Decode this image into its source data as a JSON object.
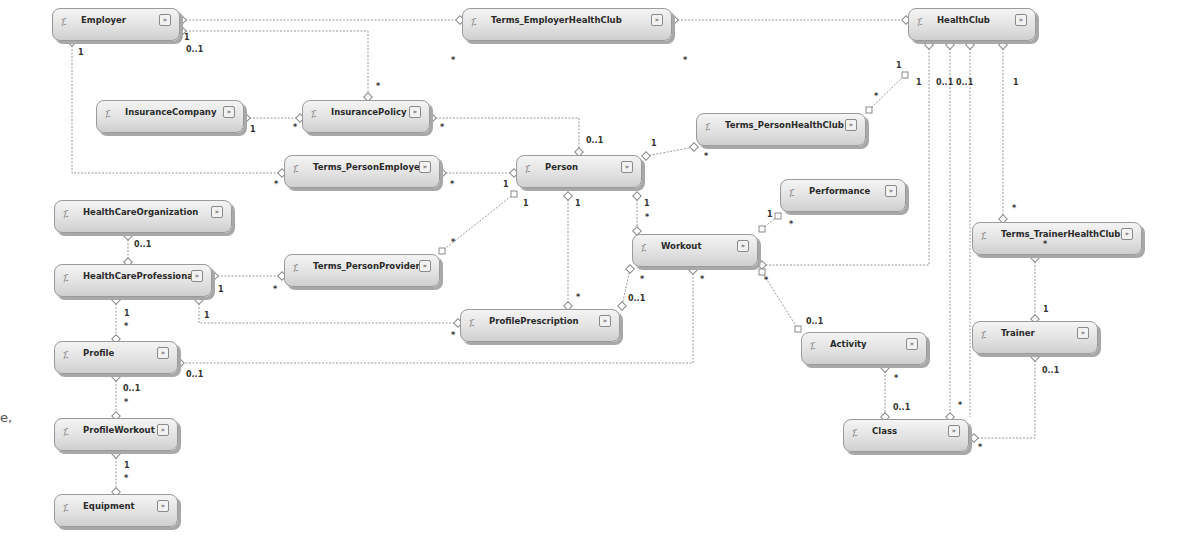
{
  "diagram": {
    "type": "entity-data-model",
    "entities": [
      {
        "id": "employer",
        "name": "Employer",
        "x": 52,
        "y": 8,
        "w": 128
      },
      {
        "id": "terms-employer-healthclub",
        "name": "Terms_EmployerHealthClub",
        "x": 462,
        "y": 8,
        "w": 210
      },
      {
        "id": "healthclub",
        "name": "HealthClub",
        "x": 908,
        "y": 8,
        "w": 128
      },
      {
        "id": "insurance-company",
        "name": "InsuranceCompany",
        "x": 96,
        "y": 100,
        "w": 148
      },
      {
        "id": "insurance-policy",
        "name": "InsurancePolicy",
        "x": 302,
        "y": 100,
        "w": 128
      },
      {
        "id": "terms-person-healthclub",
        "name": "Terms_PersonHealthClub",
        "x": 696,
        "y": 113,
        "w": 170
      },
      {
        "id": "terms-person-employer",
        "name": "Terms_PersonEmployer",
        "x": 284,
        "y": 155,
        "w": 156
      },
      {
        "id": "person",
        "name": "Person",
        "x": 516,
        "y": 155,
        "w": 126
      },
      {
        "id": "performance",
        "name": "Performance",
        "x": 780,
        "y": 179,
        "w": 126
      },
      {
        "id": "healthcare-organization",
        "name": "HealthCareOrganization",
        "x": 54,
        "y": 200,
        "w": 178
      },
      {
        "id": "workout",
        "name": "Workout",
        "x": 632,
        "y": 234,
        "w": 126
      },
      {
        "id": "terms-trainer-healthclub",
        "name": "Terms_TrainerHealthClub",
        "x": 972,
        "y": 222,
        "w": 170
      },
      {
        "id": "healthcare-professional",
        "name": "HealthCareProfessional",
        "x": 54,
        "y": 264,
        "w": 158
      },
      {
        "id": "terms-person-provider",
        "name": "Terms_PersonProvider",
        "x": 284,
        "y": 254,
        "w": 156
      },
      {
        "id": "profile-prescription",
        "name": "ProfilePrescription",
        "x": 460,
        "y": 309,
        "w": 160
      },
      {
        "id": "trainer",
        "name": "Trainer",
        "x": 972,
        "y": 321,
        "w": 126
      },
      {
        "id": "activity",
        "name": "Activity",
        "x": 801,
        "y": 332,
        "w": 126
      },
      {
        "id": "profile",
        "name": "Profile",
        "x": 54,
        "y": 341,
        "w": 124
      },
      {
        "id": "profile-workout",
        "name": "ProfileWorkout",
        "x": 54,
        "y": 418,
        "w": 124
      },
      {
        "id": "class",
        "name": "Class",
        "x": 843,
        "y": 419,
        "w": 126
      },
      {
        "id": "equipment",
        "name": "Equipment",
        "x": 54,
        "y": 494,
        "w": 124
      }
    ],
    "associations": [
      {
        "from": "Employer",
        "to": "Terms_EmployerHealthClub",
        "from_mult": "",
        "to_mult": "*"
      },
      {
        "from": "Terms_EmployerHealthClub",
        "to": "HealthClub",
        "from_mult": "*",
        "to_mult": "1"
      },
      {
        "from": "Employer",
        "to": "InsurancePolicy",
        "from_mult": "1",
        "to_mult": "*"
      },
      {
        "from": "Employer",
        "to": "Terms_PersonEmployer",
        "from_mult": "1",
        "to_mult": "*"
      },
      {
        "from": "InsuranceCompany",
        "to": "InsurancePolicy",
        "from_mult": "1",
        "to_mult": "*"
      },
      {
        "from": "InsurancePolicy",
        "to": "Person",
        "from_mult": "*",
        "to_mult": "0..1"
      },
      {
        "from": "Terms_PersonEmployer",
        "to": "Person",
        "from_mult": "*",
        "to_mult": "1"
      },
      {
        "from": "Person",
        "to": "Terms_PersonHealthClub",
        "from_mult": "1",
        "to_mult": "*"
      },
      {
        "from": "Terms_PersonHealthClub",
        "to": "HealthClub",
        "from_mult": "*",
        "to_mult": "1"
      },
      {
        "from": "Person",
        "to": "Terms_PersonProvider",
        "from_mult": "1",
        "to_mult": "*"
      },
      {
        "from": "Person",
        "to": "ProfilePrescription",
        "from_mult": "1",
        "to_mult": "*"
      },
      {
        "from": "Person",
        "to": "Workout",
        "from_mult": "1",
        "to_mult": "*"
      },
      {
        "from": "Workout",
        "to": "Performance",
        "from_mult": "1",
        "to_mult": "*"
      },
      {
        "from": "Workout",
        "to": "HealthClub",
        "from_mult": "*",
        "to_mult": "0..1"
      },
      {
        "from": "Workout",
        "to": "Activity",
        "from_mult": "*",
        "to_mult": "0..1"
      },
      {
        "from": "Workout",
        "to": "ProfilePrescription",
        "from_mult": "*",
        "to_mult": "0..1"
      },
      {
        "from": "Workout",
        "to": "Profile",
        "from_mult": "*",
        "to_mult": "0..1"
      },
      {
        "from": "HealthCareOrganization",
        "to": "HealthCareProfessional",
        "from_mult": "0..1",
        "to_mult": ""
      },
      {
        "from": "HealthCareProfessional",
        "to": "Terms_PersonProvider",
        "from_mult": "1",
        "to_mult": "*"
      },
      {
        "from": "HealthCareProfessional",
        "to": "ProfilePrescription",
        "from_mult": "1",
        "to_mult": "*"
      },
      {
        "from": "HealthCareProfessional",
        "to": "Profile",
        "from_mult": "1",
        "to_mult": "*"
      },
      {
        "from": "Profile",
        "to": "ProfileWorkout",
        "from_mult": "0..1",
        "to_mult": "*"
      },
      {
        "from": "ProfileWorkout",
        "to": "Equipment",
        "from_mult": "1",
        "to_mult": "*"
      },
      {
        "from": "HealthClub",
        "to": "Class",
        "from_mult": "0..1",
        "to_mult": "*"
      },
      {
        "from": "HealthClub",
        "to": "Terms_TrainerHealthClub",
        "from_mult": "1",
        "to_mult": "*"
      },
      {
        "from": "Terms_TrainerHealthClub",
        "to": "Trainer",
        "from_mult": "*",
        "to_mult": "1"
      },
      {
        "from": "Trainer",
        "to": "Class",
        "from_mult": "0..1",
        "to_mult": "*"
      },
      {
        "from": "Activity",
        "to": "Class",
        "from_mult": "*",
        "to_mult": "0..1"
      }
    ],
    "multiplicity_labels": [
      {
        "text": "1",
        "x": 184,
        "y": 33
      },
      {
        "text": "0..1",
        "x": 186,
        "y": 45
      },
      {
        "text": "1",
        "x": 78,
        "y": 48
      },
      {
        "text": "*",
        "x": 376,
        "y": 82
      },
      {
        "text": "1",
        "x": 250,
        "y": 125
      },
      {
        "text": "*",
        "x": 293,
        "y": 123
      },
      {
        "text": "*",
        "x": 440,
        "y": 123
      },
      {
        "text": "*",
        "x": 451,
        "y": 56
      },
      {
        "text": "*",
        "x": 683,
        "y": 56
      },
      {
        "text": "1",
        "x": 896,
        "y": 61
      },
      {
        "text": "1",
        "x": 916,
        "y": 78
      },
      {
        "text": "0..1",
        "x": 936,
        "y": 78
      },
      {
        "text": "0..1",
        "x": 956,
        "y": 78
      },
      {
        "text": "1",
        "x": 1013,
        "y": 78
      },
      {
        "text": "*",
        "x": 874,
        "y": 92
      },
      {
        "text": "0..1",
        "x": 586,
        "y": 136
      },
      {
        "text": "1",
        "x": 651,
        "y": 139
      },
      {
        "text": "*",
        "x": 704,
        "y": 152
      },
      {
        "text": "*",
        "x": 274,
        "y": 180
      },
      {
        "text": "*",
        "x": 450,
        "y": 180
      },
      {
        "text": "1",
        "x": 503,
        "y": 180
      },
      {
        "text": "1",
        "x": 523,
        "y": 199
      },
      {
        "text": "1",
        "x": 575,
        "y": 199
      },
      {
        "text": "1",
        "x": 644,
        "y": 199
      },
      {
        "text": "*",
        "x": 645,
        "y": 213
      },
      {
        "text": "1",
        "x": 767,
        "y": 210
      },
      {
        "text": "*",
        "x": 789,
        "y": 220
      },
      {
        "text": "*",
        "x": 1012,
        "y": 204
      },
      {
        "text": "0..1",
        "x": 134,
        "y": 240
      },
      {
        "text": "*",
        "x": 451,
        "y": 238
      },
      {
        "text": "1",
        "x": 218,
        "y": 285
      },
      {
        "text": "*",
        "x": 273,
        "y": 285
      },
      {
        "text": "1",
        "x": 204,
        "y": 311
      },
      {
        "text": "1",
        "x": 124,
        "y": 309
      },
      {
        "text": "*",
        "x": 124,
        "y": 322
      },
      {
        "text": "*",
        "x": 640,
        "y": 275
      },
      {
        "text": "*",
        "x": 700,
        "y": 275
      },
      {
        "text": "*",
        "x": 764,
        "y": 276
      },
      {
        "text": "0..1",
        "x": 628,
        "y": 294
      },
      {
        "text": "*",
        "x": 576,
        "y": 293
      },
      {
        "text": "*",
        "x": 451,
        "y": 331
      },
      {
        "text": "0..1",
        "x": 806,
        "y": 317
      },
      {
        "text": "*",
        "x": 1043,
        "y": 240
      },
      {
        "text": "1",
        "x": 1043,
        "y": 305
      },
      {
        "text": "0..1",
        "x": 1042,
        "y": 366
      },
      {
        "text": "0..1",
        "x": 186,
        "y": 370
      },
      {
        "text": "0..1",
        "x": 123,
        "y": 384
      },
      {
        "text": "*",
        "x": 124,
        "y": 398
      },
      {
        "text": "*",
        "x": 894,
        "y": 374
      },
      {
        "text": "0..1",
        "x": 893,
        "y": 403
      },
      {
        "text": "*",
        "x": 958,
        "y": 401
      },
      {
        "text": "*",
        "x": 978,
        "y": 443
      },
      {
        "text": "1",
        "x": 124,
        "y": 461
      },
      {
        "text": "*",
        "x": 124,
        "y": 474
      }
    ],
    "stray_text": "e,",
    "icon": "entity-type-icon",
    "expand_icon": "expand-chevron-icon"
  }
}
